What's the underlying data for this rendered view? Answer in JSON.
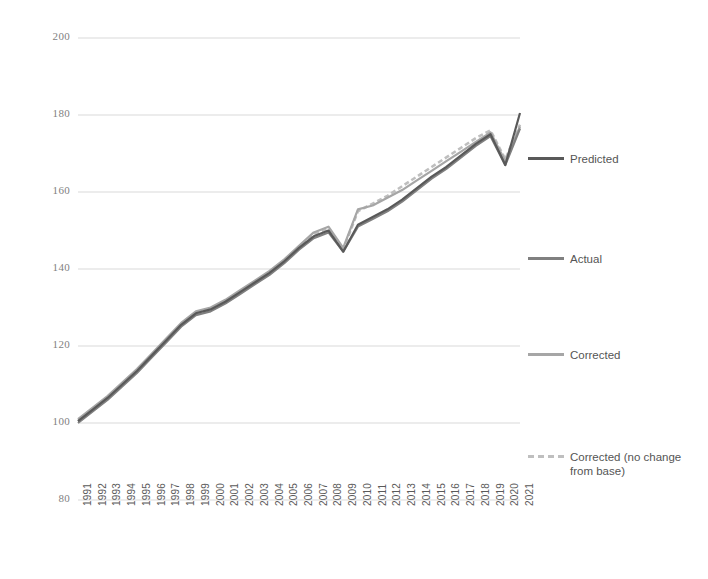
{
  "chart_data": {
    "type": "line",
    "title": "",
    "xlabel": "",
    "ylabel": "",
    "ylim": [
      80,
      200
    ],
    "yticks": [
      80,
      100,
      120,
      140,
      160,
      180,
      200
    ],
    "grid": true,
    "legend_position": "right",
    "x": [
      1991,
      1992,
      1993,
      1994,
      1995,
      1996,
      1997,
      1998,
      1999,
      2000,
      2001,
      2002,
      2003,
      2004,
      2005,
      2006,
      2007,
      2008,
      2009,
      2010,
      2011,
      2012,
      2013,
      2014,
      2015,
      2016,
      2017,
      2018,
      2019,
      2020,
      2021
    ],
    "categories": [
      "1991",
      "1992",
      "1993",
      "1994",
      "1995",
      "1996",
      "1997",
      "1998",
      "1999",
      "2000",
      "2001",
      "2002",
      "2003",
      "2004",
      "2005",
      "2006",
      "2007",
      "2008",
      "2009",
      "2010",
      "2011",
      "2012",
      "2013",
      "2014",
      "2015",
      "2016",
      "2017",
      "2018",
      "2019",
      "2020",
      "2021"
    ],
    "series": [
      {
        "name": "Predicted",
        "color": "#595959",
        "style": "solid",
        "values": [
          100.5,
          103.5,
          106.5,
          110.0,
          113.5,
          117.5,
          121.5,
          125.5,
          128.5,
          129.5,
          131.5,
          134.0,
          136.5,
          139.0,
          142.0,
          145.5,
          148.5,
          150.0,
          144.5,
          151.5,
          153.5,
          155.5,
          158.0,
          161.0,
          164.0,
          166.5,
          169.5,
          172.5,
          175.0,
          167.0,
          180.5
        ]
      },
      {
        "name": "Actual",
        "color": "#808080",
        "style": "solid",
        "values": [
          100.0,
          103.0,
          106.0,
          109.5,
          113.0,
          117.0,
          121.0,
          125.0,
          128.0,
          129.0,
          131.0,
          133.5,
          136.0,
          138.5,
          141.5,
          145.0,
          148.0,
          149.5,
          144.5,
          151.0,
          153.0,
          155.0,
          157.5,
          160.5,
          163.5,
          166.0,
          169.0,
          172.0,
          174.5,
          167.0,
          176.5
        ]
      },
      {
        "name": "Corrected",
        "color": "#a6a6a6",
        "style": "solid",
        "values": [
          101.0,
          104.0,
          107.0,
          110.5,
          114.0,
          118.0,
          122.0,
          126.0,
          129.0,
          130.0,
          132.0,
          134.5,
          137.0,
          139.5,
          142.5,
          146.0,
          149.5,
          151.0,
          145.5,
          155.5,
          156.5,
          158.5,
          160.5,
          163.0,
          165.5,
          168.0,
          170.5,
          173.0,
          175.5,
          168.0,
          177.0
        ]
      },
      {
        "name": "Corrected (no change from base)",
        "color": "#bfbfbf",
        "style": "dashed",
        "values": [
          100.5,
          103.5,
          106.5,
          110.0,
          113.5,
          117.5,
          121.5,
          125.5,
          128.5,
          129.5,
          131.5,
          134.0,
          136.5,
          139.0,
          142.0,
          145.5,
          149.0,
          150.5,
          145.0,
          155.0,
          157.0,
          159.0,
          161.5,
          164.0,
          166.5,
          169.0,
          171.5,
          174.0,
          176.0,
          168.5,
          177.5
        ]
      }
    ]
  },
  "legend": {
    "items": [
      {
        "label": "Predicted",
        "color": "#595959",
        "style": "solid"
      },
      {
        "label": "Actual",
        "color": "#808080",
        "style": "solid"
      },
      {
        "label": "Corrected",
        "color": "#a6a6a6",
        "style": "solid"
      },
      {
        "label": "Corrected (no change from base)",
        "color": "#bfbfbf",
        "style": "dashed"
      }
    ]
  },
  "axis": {
    "y_tick_labels": [
      "200",
      "180",
      "160",
      "140",
      "120",
      "100",
      "80"
    ],
    "x_tick_labels": [
      "1991",
      "1992",
      "1993",
      "1994",
      "1995",
      "1996",
      "1997",
      "1998",
      "1999",
      "2000",
      "2001",
      "2002",
      "2003",
      "2004",
      "2005",
      "2006",
      "2007",
      "2008",
      "2009",
      "2010",
      "2011",
      "2012",
      "2013",
      "2014",
      "2015",
      "2016",
      "2017",
      "2018",
      "2019",
      "2020",
      "2021"
    ]
  },
  "style": {
    "gridline_color": "#d9d9d9",
    "background": "#ffffff"
  }
}
